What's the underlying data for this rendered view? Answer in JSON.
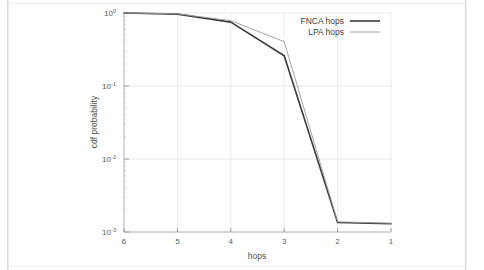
{
  "figure": {
    "background_color": "#ffffff",
    "border_color": "#d9d9d9"
  },
  "chart_data": {
    "type": "line",
    "title": "",
    "xlabel": "hops",
    "ylabel": "cdf probability",
    "x_categories": [
      "6",
      "5",
      "4",
      "3",
      "2",
      "1"
    ],
    "x_reversed": true,
    "xlim": [
      6,
      1
    ],
    "yscale": "log",
    "ylim": [
      0.001,
      1.0
    ],
    "y_tick_labels": [
      "10",
      "10",
      "10",
      "10"
    ],
    "y_tick_exponents": [
      "0",
      "-1",
      "-2",
      "-3"
    ],
    "y_tick_values": [
      1.0,
      0.1,
      0.01,
      0.001
    ],
    "grid": true,
    "legend_position": "top-right",
    "series": [
      {
        "name": "FNCA hops",
        "color": "#3a3a3a",
        "line_width": 1.6,
        "values": [
          1.0,
          0.965,
          0.75,
          0.26,
          0.00135,
          0.0013
        ]
      },
      {
        "name": "LPA hops",
        "color": "#9a9a9a",
        "line_width": 0.9,
        "values": [
          1.0,
          0.975,
          0.785,
          0.405,
          0.00138,
          0.00132
        ]
      }
    ]
  },
  "axes": {
    "x_title": "hops",
    "y_title": "cdf probability"
  },
  "legend": {
    "entries": [
      {
        "label": "FNCA hops"
      },
      {
        "label": "LPA hops"
      }
    ]
  }
}
